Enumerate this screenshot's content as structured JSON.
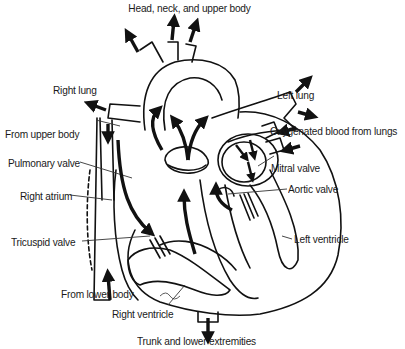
{
  "diagram": {
    "type": "anatomical line drawing",
    "colors": {
      "line": "#111111",
      "background": "#ffffff",
      "text": "#1a1a1a"
    },
    "labels": {
      "head_neck": "Head, neck, and upper body",
      "right_lung": "Right lung",
      "left_lung": "Left lung",
      "from_upper_body": "From upper body",
      "oxygenated_blood": "Oxygenated blood from lungs",
      "pulmonary_valve": "Pulmonary valve",
      "mitral_valve": "Mitral valve",
      "aortic_valve": "Aortic valve",
      "right_atrium": "Right atrium",
      "tricuspid_valve": "Tricuspid valve",
      "left_ventricle": "Left ventricle",
      "from_lower_body": "From lower body",
      "right_ventricle": "Right ventricle",
      "trunk_lower": "Trunk and lower extremities"
    }
  }
}
